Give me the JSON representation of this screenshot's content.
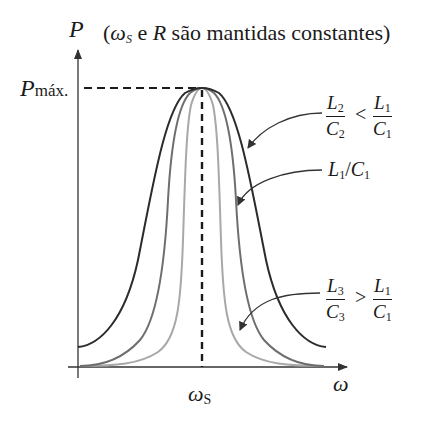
{
  "title": {
    "y_axis_symbol": "P",
    "annotation_prefix": "(",
    "annotation_omega": "ω",
    "annotation_omega_sub": "S",
    "annotation_middle": " e ",
    "annotation_R": "R",
    "annotation_suffix": " são mantidas constantes)"
  },
  "axes": {
    "y_label": "P",
    "y_max_label_main": "P",
    "y_max_label_sub": "máx.",
    "x_label": "ω",
    "x_center_label_main": "ω",
    "x_center_label_sub": "S"
  },
  "curves": [
    {
      "name": "wide",
      "color": "#2b2b2b",
      "label_num_L": "L",
      "label_num_sub": "2",
      "label_den_C": "C",
      "label_den_sub": "2",
      "relation": "<",
      "ref_num_L": "L",
      "ref_num_sub": "1",
      "ref_den_C": "C",
      "ref_den_sub": "1"
    },
    {
      "name": "reference",
      "color": "#6e6e6e",
      "label_L": "L",
      "label_L_sub": "1",
      "label_slash": "/",
      "label_C": "C",
      "label_C_sub": "1"
    },
    {
      "name": "narrow",
      "color": "#a8a8a8",
      "label_num_L": "L",
      "label_num_sub": "3",
      "label_den_C": "C",
      "label_den_sub": "3",
      "relation": ">",
      "ref_num_L": "L",
      "ref_num_sub": "1",
      "ref_den_C": "C",
      "ref_den_sub": "1"
    }
  ],
  "colors": {
    "axis": "#333333",
    "dashes": "#1a1a1a",
    "text": "#1a1a1a"
  }
}
